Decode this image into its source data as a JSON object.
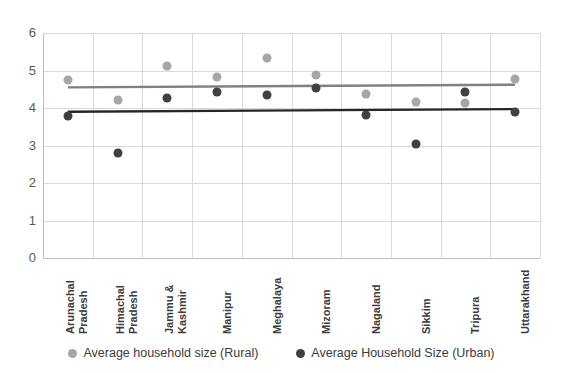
{
  "chart_data": {
    "type": "scatter",
    "title": "",
    "xlabel": "",
    "ylabel": "",
    "ylim": [
      0,
      6
    ],
    "yticks": [
      "0",
      "1",
      "2",
      "3",
      "4",
      "5",
      "6"
    ],
    "grid": true,
    "legend_position": "bottom",
    "categories": [
      "Arunachal Pradesh",
      "Himachal Pradesh",
      "Jammu & Kashmir",
      "Manipur",
      "Meghalaya",
      "Mizoram",
      "Nagaland",
      "Sikkim",
      "Tripura",
      "Uttarakhand"
    ],
    "category_lines": [
      [
        "Arunachal",
        "Pradesh"
      ],
      [
        "Himachal",
        "Pradesh"
      ],
      [
        "Jammu &",
        "Kashmir"
      ],
      [
        "Manipur"
      ],
      [
        "Meghalaya"
      ],
      [
        "Mizoram"
      ],
      [
        "Nagaland"
      ],
      [
        "Sikkim"
      ],
      [
        "Tripura"
      ],
      [
        "Uttarakhand"
      ]
    ],
    "series": [
      {
        "name": "Average household size (Rural)",
        "color": "#a6a6a6",
        "values": [
          4.75,
          4.21,
          5.12,
          4.83,
          5.33,
          4.88,
          4.38,
          4.16,
          4.13,
          4.77
        ],
        "trendline": {
          "start": 4.55,
          "end": 4.62,
          "color": "#808080"
        }
      },
      {
        "name": "Average Household Size (Urban)",
        "color": "#404040",
        "values": [
          3.79,
          2.8,
          4.27,
          4.43,
          4.35,
          4.53,
          3.82,
          3.04,
          4.43,
          3.89
        ],
        "trendline": {
          "start": 3.9,
          "end": 3.97,
          "color": "#262626"
        }
      }
    ]
  }
}
